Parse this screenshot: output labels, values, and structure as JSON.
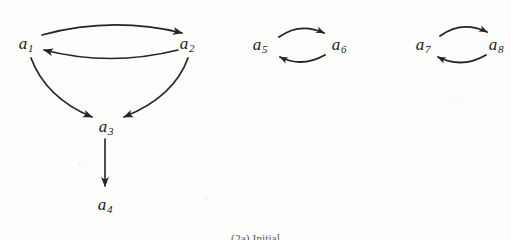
{
  "figure": {
    "background_color": "#fdfdfc",
    "ink_color": "#1f1f1f",
    "caption": "(2a) Initial",
    "width": 511,
    "height": 240
  },
  "nodes": [
    {
      "id": "a1",
      "base": "a",
      "sub": "1",
      "x": 26,
      "y": 43
    },
    {
      "id": "a2",
      "base": "a",
      "sub": "2",
      "x": 187,
      "y": 43
    },
    {
      "id": "a3",
      "base": "a",
      "sub": "3",
      "x": 106,
      "y": 126
    },
    {
      "id": "a4",
      "base": "a",
      "sub": "4",
      "x": 105,
      "y": 204
    },
    {
      "id": "a5",
      "base": "a",
      "sub": "5",
      "x": 260,
      "y": 44
    },
    {
      "id": "a6",
      "base": "a",
      "sub": "6",
      "x": 339,
      "y": 44
    },
    {
      "id": "a7",
      "base": "a",
      "sub": "7",
      "x": 423,
      "y": 44
    },
    {
      "id": "a8",
      "base": "a",
      "sub": "8",
      "x": 496,
      "y": 44
    }
  ],
  "edges": [
    {
      "id": "e1",
      "from": "a1",
      "to": "a2",
      "style": "curve-up",
      "component": 1
    },
    {
      "id": "e2",
      "from": "a2",
      "to": "a1",
      "style": "curve-down",
      "component": 1
    },
    {
      "id": "e3",
      "from": "a1",
      "to": "a3",
      "style": "curve",
      "component": 1
    },
    {
      "id": "e4",
      "from": "a2",
      "to": "a3",
      "style": "curve",
      "component": 1
    },
    {
      "id": "e5",
      "from": "a3",
      "to": "a4",
      "style": "straight",
      "component": 1
    },
    {
      "id": "e6",
      "from": "a5",
      "to": "a6",
      "style": "curve-up",
      "component": 2
    },
    {
      "id": "e7",
      "from": "a6",
      "to": "a5",
      "style": "curve-down",
      "component": 2
    },
    {
      "id": "e8",
      "from": "a7",
      "to": "a8",
      "style": "curve-up",
      "component": 3
    },
    {
      "id": "e9",
      "from": "a8",
      "to": "a7",
      "style": "curve-down",
      "component": 3
    }
  ],
  "components": [
    {
      "name": "component-one",
      "nodes": [
        "a1",
        "a2",
        "a3",
        "a4"
      ]
    },
    {
      "name": "component-two",
      "nodes": [
        "a5",
        "a6"
      ]
    },
    {
      "name": "component-three",
      "nodes": [
        "a7",
        "a8"
      ]
    }
  ]
}
